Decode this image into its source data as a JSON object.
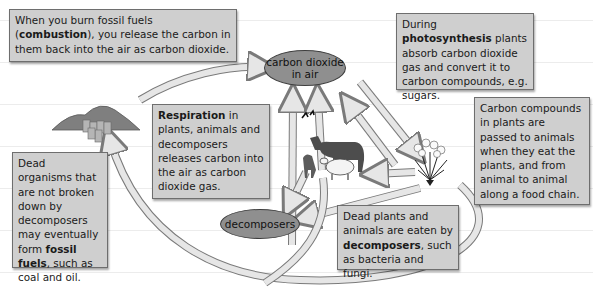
{
  "diagram": {
    "nodes": {
      "co2_air": {
        "line1": "carbon dioxide",
        "line2": "in air"
      },
      "decomposers": {
        "label": "decomposers"
      }
    },
    "boxes": {
      "combustion": {
        "pre": "When you burn fossil fuels (",
        "bold": "combustion",
        "post": "), you release the carbon in them back into the air as carbon dioxide."
      },
      "photosynthesis": {
        "pre": "During ",
        "bold": "photosynthesis",
        "post": " plants absorb carbon dioxide gas and convert it to carbon compounds, e.g. sugars."
      },
      "respiration": {
        "bold": "Respiration",
        "post": " in plants, animals and decomposers releases carbon into the air as carbon dioxide gas."
      },
      "food_chain": {
        "text": "Carbon compounds in plants are passed to animals when they eat the plants, and from animal to animal along a food chain."
      },
      "decomposition": {
        "pre": "Dead plants and animals are eaten by ",
        "bold": "decomposers",
        "post": ", such as bacteria and fungi."
      },
      "fossil": {
        "pre": "Dead organisms that are not broken down by decomposers may eventually form ",
        "bold": "fossil fuels",
        "post": ", such as coal and oil."
      }
    },
    "illustrations": [
      "fossil-fuel-mounds-and-barrels",
      "animals-horse-sheep-lamb-birds",
      "plant-flowering-shrub"
    ],
    "colors": {
      "box_fill": "#cfcfcf",
      "ellipse_fill": "#8f8f8f",
      "arrow_fill": "#e6e6e6",
      "arrow_stroke": "#7a7a7a"
    }
  }
}
